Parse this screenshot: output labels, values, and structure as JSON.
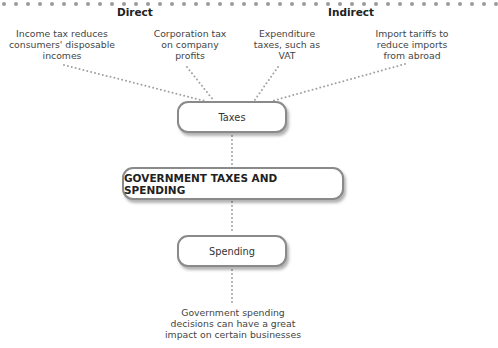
{
  "header": {
    "partial_title": "Government taxes and spending"
  },
  "categories": {
    "direct": "Direct",
    "indirect": "Indirect"
  },
  "tax_examples": [
    {
      "label": "Income tax reduces consumers' disposable incomes"
    },
    {
      "label": "Corporation tax on company profits"
    },
    {
      "label": "Expenditure taxes, such as VAT"
    },
    {
      "label": "Import tariffs to reduce imports from abroad"
    }
  ],
  "nodes": {
    "taxes": "Taxes",
    "main": "GOVERNMENT TAXES AND SPENDING",
    "spending": "Spending"
  },
  "spending_note": "Government spending decisions can have a great impact on certain businesses",
  "colors": {
    "dots": "#9a9a9a",
    "box_border": "#8a8a8a",
    "text": "#333333"
  }
}
